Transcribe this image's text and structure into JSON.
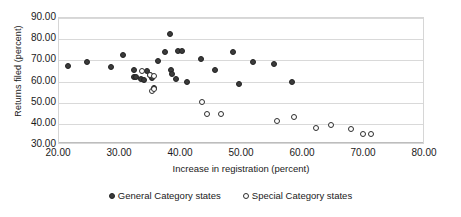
{
  "chart_data": {
    "type": "scatter",
    "title": "",
    "xlabel": "Increase in registration (percent)",
    "ylabel": "Returns filed (percent)",
    "xlim": [
      20.0,
      80.0
    ],
    "ylim": [
      30.0,
      90.0
    ],
    "xticks": [
      "20.00",
      "30.00",
      "40.00",
      "50.00",
      "60.00",
      "70.00",
      "80.00"
    ],
    "yticks": [
      "30.00",
      "40.00",
      "50.00",
      "60.00",
      "70.00",
      "80.00",
      "90.00"
    ],
    "xtick_values": [
      20,
      30,
      40,
      50,
      60,
      70,
      80
    ],
    "ytick_values": [
      30,
      40,
      50,
      60,
      70,
      80,
      90
    ],
    "grid": "horizontal",
    "legend_position": "bottom",
    "series": [
      {
        "name": "General Category states",
        "marker": "filled-circle",
        "color": "#3b3b3b",
        "points": [
          [
            21.5,
            67.5
          ],
          [
            24.6,
            69.2
          ],
          [
            28.5,
            66.7
          ],
          [
            30.5,
            72.5
          ],
          [
            32.3,
            65.2
          ],
          [
            32.3,
            62.0
          ],
          [
            32.6,
            61.9
          ],
          [
            33.4,
            61.0
          ],
          [
            34.0,
            60.5
          ],
          [
            34.5,
            65.0
          ],
          [
            34.9,
            63.3
          ],
          [
            35.2,
            61.5
          ],
          [
            35.5,
            56.8
          ],
          [
            36.3,
            69.5
          ],
          [
            37.4,
            74.0
          ],
          [
            38.2,
            82.5
          ],
          [
            38.3,
            65.5
          ],
          [
            38.5,
            63.6
          ],
          [
            39.2,
            61.3
          ],
          [
            39.5,
            74.2
          ],
          [
            40.2,
            74.2
          ],
          [
            41.0,
            59.6
          ],
          [
            43.3,
            70.8
          ],
          [
            45.5,
            65.2
          ],
          [
            48.5,
            74.0
          ],
          [
            49.5,
            59.0
          ],
          [
            51.8,
            69.2
          ],
          [
            55.3,
            68.5
          ],
          [
            58.2,
            59.8
          ]
        ]
      },
      {
        "name": "Special Category states",
        "marker": "open-circle",
        "color": "#ffffff",
        "points": [
          [
            33.6,
            65.0
          ],
          [
            34.9,
            63.2
          ],
          [
            35.6,
            62.8
          ],
          [
            35.2,
            55.5
          ],
          [
            35.6,
            56.5
          ],
          [
            43.4,
            50.3
          ],
          [
            44.2,
            44.8
          ],
          [
            46.6,
            44.8
          ],
          [
            55.8,
            41.5
          ],
          [
            58.5,
            43.3
          ],
          [
            62.1,
            38.2
          ],
          [
            64.6,
            39.3
          ],
          [
            67.8,
            37.5
          ],
          [
            69.8,
            35.3
          ],
          [
            71.2,
            35.3
          ]
        ]
      }
    ]
  },
  "legend": {
    "items": [
      {
        "label": "General Category states",
        "marker": "filled-circle"
      },
      {
        "label": "Special Category states",
        "marker": "open-circle"
      }
    ]
  }
}
